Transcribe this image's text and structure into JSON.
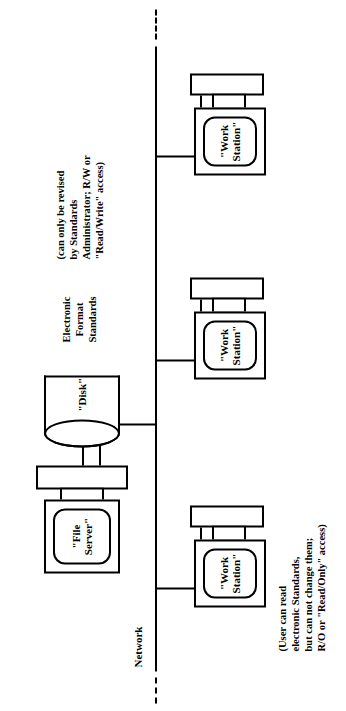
{
  "diagram": {
    "network_label": "Network",
    "file_server": {
      "label": "\"File\nServer\""
    },
    "disk": {
      "label": "\"Disk\""
    },
    "workstations": [
      {
        "label": "\"Work\nStation\""
      },
      {
        "label": "\"Work\nStation\""
      },
      {
        "label": "\"Work\nStation\""
      }
    ],
    "annotations": {
      "standards": "Electronic\nFormat\nStandards",
      "admin_access": "(can only be revised\nby Standards\nAdministrator; R/W or\n\"Read/Write\" access)",
      "user_access": "(User can read\nelectronic Standards,\nbut can not change them;\nR/O or \"Read/Only\" access)"
    },
    "colors": {
      "ink": "#000000",
      "paper": "#ffffff"
    }
  }
}
